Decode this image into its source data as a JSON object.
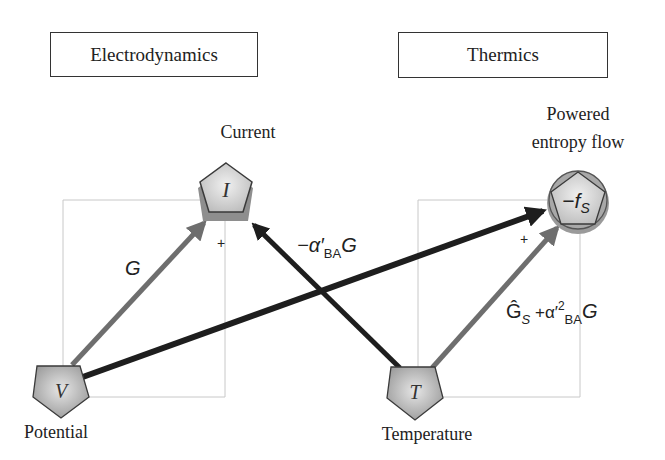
{
  "headers": {
    "left": "Electrodynamics",
    "right": "Thermics"
  },
  "nodes": {
    "current": {
      "symbol": "I",
      "label": "Current"
    },
    "entropy": {
      "symbol": "−f",
      "subscript": "S",
      "label_line1": "Powered",
      "label_line2": "entropy flow"
    },
    "potential": {
      "symbol": "V",
      "label": "Potential"
    },
    "temperature": {
      "symbol": "T",
      "label": "Temperature"
    }
  },
  "edges": {
    "v_to_i": {
      "label": "G",
      "sign": "+"
    },
    "t_to_i": {
      "label_prefix": "−α′",
      "label_sub": "BA",
      "label_suffix": "G"
    },
    "t_to_s": {
      "label_hat": "Ĝ",
      "label_hat_sub": "S",
      "label_mid": " +α′",
      "label_sup": "2",
      "label_sub": "BA",
      "label_suffix": "G",
      "sign": "+"
    },
    "v_to_s": {}
  },
  "colors": {
    "gray_arrow": "#6e6e6e",
    "dark_arrow": "#1e1e1e",
    "node_fill": "#bdbdbd",
    "node_stroke": "#3a3a3a",
    "frame": "#c8c8c8"
  }
}
